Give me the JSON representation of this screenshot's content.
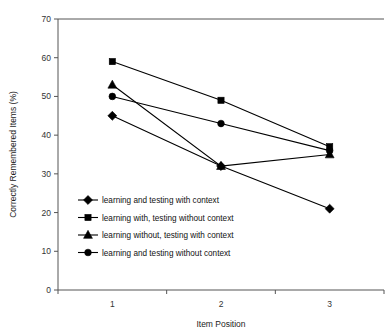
{
  "chart_data": {
    "type": "line",
    "title": "",
    "xlabel": "Item Position",
    "ylabel": "Correctly Remembered Items (%)",
    "categories": [
      "1",
      "2",
      "3"
    ],
    "x": [
      1,
      2,
      3
    ],
    "ylim": [
      0,
      70
    ],
    "yticks": [
      "0",
      "10",
      "20",
      "30",
      "40",
      "50",
      "60",
      "70"
    ],
    "ytick_values": [
      0,
      10,
      20,
      30,
      40,
      50,
      60,
      70
    ],
    "grid": false,
    "legend_position": "inside-lower-left",
    "series": [
      {
        "name": "learning and testing with context",
        "marker": "diamond",
        "values": [
          45,
          32,
          21
        ]
      },
      {
        "name": "learning with, testing without context",
        "marker": "square",
        "values": [
          59,
          49,
          37
        ]
      },
      {
        "name": "learning without, testing with context",
        "marker": "triangle",
        "values": [
          53,
          32,
          35
        ]
      },
      {
        "name": "learning and testing without context",
        "marker": "circle",
        "values": [
          50,
          43,
          36
        ]
      }
    ],
    "colors": {
      "line": "#000000",
      "marker": "#000000",
      "axis": "#555555",
      "background": "#ffffff"
    }
  }
}
